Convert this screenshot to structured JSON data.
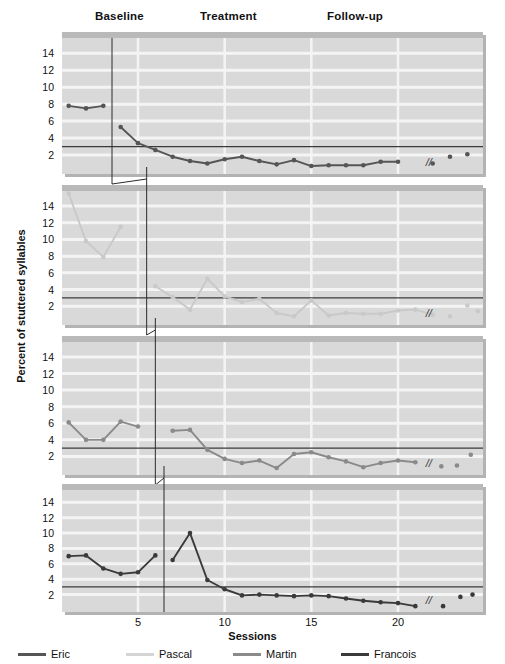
{
  "figure": {
    "phase_labels": [
      {
        "text": "Baseline",
        "x": 95,
        "y": 10
      },
      {
        "text": "Treatment",
        "x": 200,
        "y": 10
      },
      {
        "text": "Follow-up",
        "x": 327,
        "y": 10
      }
    ],
    "xlabel": "Sessions",
    "ylabel": "Percent of stuttered syllables",
    "break_marker": "//"
  },
  "legend": {
    "items": [
      {
        "label": "Eric",
        "color": "#555555",
        "x": 18
      },
      {
        "label": "Pascal",
        "color": "#d5d5d5",
        "x": 126
      },
      {
        "label": "Martin",
        "color": "#8a8a8a",
        "x": 233
      },
      {
        "label": "Francois",
        "color": "#3a3a3a",
        "x": 341
      }
    ]
  },
  "chart_data": {
    "type": "line",
    "title": "",
    "subtitle": "",
    "xlabel": "Sessions",
    "ylabel": "Percent of stuttered syllables",
    "xlim": [
      0,
      24.5
    ],
    "ylim": [
      0,
      15.5
    ],
    "xticks": [
      5,
      10,
      15,
      20
    ],
    "yticks": [
      2,
      4,
      6,
      8,
      10,
      12,
      14
    ],
    "grid": true,
    "legend_position": "bottom",
    "criterion_line_y": 3,
    "phases": [
      "Baseline",
      "Treatment",
      "Follow-up"
    ],
    "panels": [
      {
        "name": "Eric",
        "color": "#555555",
        "phase_change_x": 3.5,
        "baseline": {
          "x": [
            1,
            2,
            3
          ],
          "y": [
            7.8,
            7.5,
            7.8
          ]
        },
        "treatment": {
          "x": [
            4,
            5,
            6,
            7,
            8,
            9,
            10,
            11,
            12,
            13,
            14,
            15,
            16,
            17,
            18
          ],
          "y": [
            5.3,
            3.4,
            2.6,
            1.8,
            1.3,
            1.0,
            1.5,
            1.8,
            1.3,
            0.9,
            1.4,
            0.7,
            0.8,
            0.8,
            0.8
          ]
        },
        "treatment_tail": {
          "x": [
            19,
            20
          ],
          "y": [
            1.2,
            1.2
          ]
        },
        "followup": {
          "x": [
            22,
            23,
            24
          ],
          "y": [
            1.0,
            1.8,
            2.1
          ]
        }
      },
      {
        "name": "Pascal",
        "color": "#c9c9c9",
        "phase_change_x": 5.5,
        "baseline": {
          "x": [
            1,
            2,
            3,
            4
          ],
          "y": [
            15.5,
            9.8,
            7.9,
            11.5
          ]
        },
        "treatment": {
          "x": [
            6,
            7,
            8,
            9,
            10,
            11,
            12,
            13,
            14,
            15,
            16,
            17,
            18,
            19,
            20,
            21
          ],
          "y": [
            4.4,
            3.1,
            1.6,
            5.3,
            3.2,
            2.5,
            2.9,
            1.2,
            0.8,
            2.7,
            0.9,
            1.2,
            1.1,
            1.1,
            1.5,
            1.6
          ]
        },
        "treatment_tail": {
          "x": [
            22
          ],
          "y": [
            1.0
          ]
        },
        "followup": {
          "x": [
            23,
            24,
            24.6
          ],
          "y": [
            0.8,
            2.1,
            1.4
          ]
        }
      },
      {
        "name": "Martin",
        "color": "#8a8a8a",
        "phase_change_x": 6.0,
        "baseline": {
          "x": [
            1,
            2,
            3,
            4,
            5
          ],
          "y": [
            6.1,
            4.0,
            4.0,
            6.2,
            5.6
          ]
        },
        "treatment": {
          "x": [
            7,
            8,
            9,
            10,
            11,
            12,
            13,
            14,
            15,
            16,
            17,
            18,
            19,
            20
          ],
          "y": [
            5.1,
            5.2,
            2.8,
            1.7,
            1.2,
            1.5,
            0.6,
            2.3,
            2.5,
            1.9,
            1.4,
            0.7,
            1.2,
            1.5
          ]
        },
        "treatment_tail": {
          "x": [
            21
          ],
          "y": [
            1.3
          ]
        },
        "followup": {
          "x": [
            22.5,
            23.4,
            24.2
          ],
          "y": [
            0.8,
            0.9,
            2.2
          ]
        }
      },
      {
        "name": "Francois",
        "color": "#3a3a3a",
        "phase_change_x": 6.5,
        "baseline": {
          "x": [
            1,
            2,
            3,
            4,
            5,
            6
          ],
          "y": [
            7.0,
            7.1,
            5.4,
            4.7,
            4.9,
            7.1
          ]
        },
        "treatment": {
          "x": [
            7,
            8,
            9,
            10,
            11,
            12,
            13,
            14,
            15,
            16,
            17,
            18,
            19,
            20,
            21
          ],
          "y": [
            6.5,
            10.0,
            3.9,
            2.7,
            1.9,
            2.0,
            1.9,
            1.8,
            1.9,
            1.8,
            1.5,
            1.2,
            1.0,
            0.9,
            0.5
          ]
        },
        "treatment_tail": {
          "x": [],
          "y": []
        },
        "followup": {
          "x": [
            22.6,
            23.6,
            24.3
          ],
          "y": [
            0.5,
            1.7,
            2.0
          ]
        }
      }
    ]
  }
}
